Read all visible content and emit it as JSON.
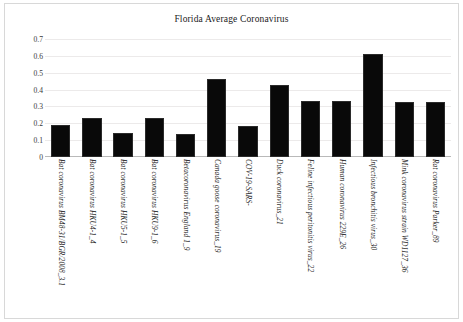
{
  "chart_data": {
    "type": "bar",
    "title": "Florida Average Coronavirus",
    "xlabel": "",
    "ylabel": "",
    "ylim": [
      0,
      0.7
    ],
    "ytick_labels": [
      "0.7",
      "0.6",
      "0.5",
      "0.4",
      "0.3",
      "0.2",
      "0.1",
      "0"
    ],
    "ytick_values": [
      0.7,
      0.6,
      0.5,
      0.4,
      0.3,
      0.2,
      0.1,
      0
    ],
    "grid": true,
    "legend": "none",
    "bar_color": "#090909",
    "categories": [
      "Bat coronavirus BM48-31/BGR/2008_3.1",
      "Bat coronavirus HKU4-1_4",
      "Bat coronavirus HKU5-1_5",
      "Bat coronavirus HKU9-1_6",
      "Betacoronavirus England 1_9",
      "Canada goose coronavirus_19",
      "COV-19-SARS-",
      "Duck coronavirus_21",
      "Feline infectious peritonitis virus_22",
      "Human coronavirus 229E_26",
      "Infectious bronchitis virus_30",
      "Mink coronavirus strain WD1127_36",
      "Rat coronavirus Parker_89"
    ],
    "values": [
      0.19,
      0.23,
      0.14,
      0.23,
      0.135,
      0.465,
      0.185,
      0.425,
      0.33,
      0.33,
      0.61,
      0.325,
      0.325
    ]
  }
}
